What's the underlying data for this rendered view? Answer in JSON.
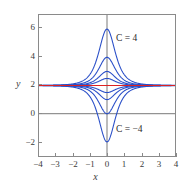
{
  "figure": {
    "background_color": "#ffffff",
    "frame_color": "#8a8a8a"
  },
  "axes": {
    "x_name": "x",
    "y_name": "y",
    "x_ticks": [
      "−4",
      "−3",
      "−2",
      "−1",
      "0",
      "1",
      "2",
      "3",
      "4"
    ],
    "y_ticks": [
      "6",
      "4",
      "2",
      "0",
      "−2"
    ],
    "x_range": [
      -4,
      4
    ],
    "y_range": [
      -3,
      7
    ]
  },
  "annotations": {
    "top_label": "C = 4",
    "bottom_label": "C = −4"
  },
  "colors": {
    "curve": "#2a4fc8",
    "equilibrium": "#dd2222",
    "axis_line": "#555555",
    "frame": "#8a8a8a",
    "tick_text": "#3b3b3b"
  },
  "chart_data": {
    "type": "line",
    "title": "",
    "xlabel": "x",
    "ylabel": "y",
    "xlim": [
      -4,
      4
    ],
    "ylim": [
      -3,
      7
    ],
    "grid": false,
    "legend": "none",
    "equilibrium_line": {
      "name": "C = 0 (equilibrium)",
      "y": 2,
      "color": "#dd2222"
    },
    "x": [
      -4,
      -3.5,
      -3,
      -2.5,
      -2,
      -1.5,
      -1,
      -0.75,
      -0.5,
      -0.25,
      0,
      0.25,
      0.5,
      0.75,
      1,
      1.5,
      2,
      2.5,
      3,
      3.5,
      4
    ],
    "series": [
      {
        "name": "C = 4",
        "peak": 6,
        "color": "#2a4fc8",
        "values": [
          2.01,
          2.02,
          2.04,
          2.09,
          2.21,
          2.52,
          3.3,
          3.88,
          4.55,
          5.35,
          6,
          5.35,
          4.55,
          3.88,
          3.3,
          2.52,
          2.21,
          2.09,
          2.04,
          2.02,
          2.01
        ]
      },
      {
        "name": "C = 2",
        "peak": 4,
        "color": "#2a4fc8",
        "values": [
          2.0,
          2.01,
          2.02,
          2.05,
          2.11,
          2.26,
          2.65,
          2.94,
          3.27,
          3.68,
          4,
          3.68,
          3.27,
          2.94,
          2.65,
          2.26,
          2.11,
          2.05,
          2.02,
          2.01,
          2.0
        ]
      },
      {
        "name": "C = 1",
        "peak": 3,
        "color": "#2a4fc8",
        "values": [
          2.0,
          2.0,
          2.01,
          2.02,
          2.05,
          2.13,
          2.33,
          2.47,
          2.64,
          2.84,
          3,
          2.84,
          2.64,
          2.47,
          2.33,
          2.13,
          2.05,
          2.02,
          2.01,
          2.0,
          2.0
        ]
      },
      {
        "name": "C = 0.5",
        "peak": 2.5,
        "color": "#2a4fc8",
        "values": [
          2.0,
          2.0,
          2.0,
          2.01,
          2.03,
          2.07,
          2.16,
          2.23,
          2.32,
          2.42,
          2.5,
          2.42,
          2.32,
          2.23,
          2.16,
          2.07,
          2.03,
          2.01,
          2.0,
          2.0,
          2.0
        ]
      },
      {
        "name": "C = −0.5",
        "peak": 1.5,
        "color": "#2a4fc8",
        "values": [
          2.0,
          2.0,
          2.0,
          1.99,
          1.97,
          1.93,
          1.84,
          1.77,
          1.68,
          1.58,
          1.5,
          1.58,
          1.68,
          1.77,
          1.84,
          1.93,
          1.97,
          1.99,
          2.0,
          2.0,
          2.0
        ]
      },
      {
        "name": "C = −1",
        "peak": 1,
        "color": "#2a4fc8",
        "values": [
          2.0,
          2.0,
          1.99,
          1.98,
          1.95,
          1.87,
          1.67,
          1.53,
          1.36,
          1.16,
          1.0,
          1.16,
          1.36,
          1.53,
          1.67,
          1.87,
          1.95,
          1.98,
          1.99,
          2.0,
          2.0
        ]
      },
      {
        "name": "C = −2",
        "peak": 0,
        "color": "#2a4fc8",
        "values": [
          2.0,
          1.99,
          1.98,
          1.95,
          1.89,
          1.74,
          1.35,
          1.06,
          0.73,
          0.32,
          0,
          0.32,
          0.73,
          1.06,
          1.35,
          1.74,
          1.89,
          1.95,
          1.98,
          1.99,
          2.0
        ]
      },
      {
        "name": "C = −4",
        "peak": -2,
        "color": "#2a4fc8",
        "values": [
          1.99,
          1.98,
          1.96,
          1.91,
          1.79,
          1.48,
          0.7,
          0.12,
          -0.55,
          -1.35,
          -2,
          -1.35,
          -0.55,
          0.12,
          0.7,
          1.48,
          1.79,
          1.91,
          1.96,
          1.98,
          1.99
        ]
      }
    ]
  }
}
